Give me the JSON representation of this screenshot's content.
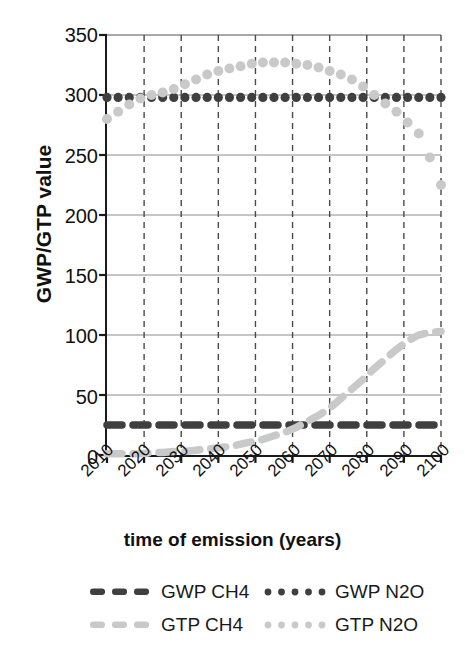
{
  "chart_data": {
    "type": "line",
    "title": "",
    "xlabel": "time of emission (years)",
    "ylabel": "GWP/GTP value",
    "xlim": [
      2010,
      2100
    ],
    "ylim": [
      0,
      350
    ],
    "grid": true,
    "grid_style": {
      "x_gridlines": "dashed",
      "y_gridlines": "solid"
    },
    "legend_position": "bottom",
    "x_ticks": [
      "2010",
      "2020",
      "2030",
      "2040",
      "2050",
      "2060",
      "2070",
      "2080",
      "2090",
      "2100"
    ],
    "x_tick_values": [
      2010,
      2020,
      2030,
      2040,
      2050,
      2060,
      2070,
      2080,
      2090,
      2100
    ],
    "y_ticks": [
      "0",
      "50",
      "100",
      "150",
      "200",
      "250",
      "300",
      "350"
    ],
    "y_tick_values": [
      0,
      50,
      100,
      150,
      200,
      250,
      300,
      350
    ],
    "x": [
      2010,
      2013,
      2016,
      2019,
      2022,
      2025,
      2028,
      2031,
      2034,
      2037,
      2040,
      2043,
      2046,
      2049,
      2052,
      2055,
      2058,
      2061,
      2064,
      2067,
      2070,
      2073,
      2076,
      2079,
      2082,
      2085,
      2088,
      2091,
      2094,
      2097,
      2100
    ],
    "series": [
      {
        "name": "GWP CH4",
        "style": "dashed",
        "color": "#3f3f3f",
        "constant": 25,
        "values": [
          25,
          25,
          25,
          25,
          25,
          25,
          25,
          25,
          25,
          25,
          25,
          25,
          25,
          25,
          25,
          25,
          25,
          25,
          25,
          25,
          25,
          25,
          25,
          25,
          25,
          25,
          25,
          25,
          25,
          25,
          25
        ]
      },
      {
        "name": "GWP N2O",
        "style": "dotted",
        "color": "#3f3f3f",
        "constant": 298,
        "values": [
          298,
          298,
          298,
          298,
          298,
          298,
          298,
          298,
          298,
          298,
          298,
          298,
          298,
          298,
          298,
          298,
          298,
          298,
          298,
          298,
          298,
          298,
          298,
          298,
          298,
          298,
          298,
          298,
          298,
          298,
          298
        ]
      },
      {
        "name": "GTP CH4",
        "style": "dashed",
        "color": "#c9c9c9",
        "values": [
          1,
          1,
          1,
          1,
          2,
          2,
          3,
          3,
          4,
          5,
          6,
          7,
          9,
          11,
          13,
          16,
          19,
          23,
          28,
          33,
          39,
          47,
          55,
          63,
          72,
          80,
          88,
          95,
          100,
          102,
          103
        ]
      },
      {
        "name": "GTP N2O",
        "style": "dotted",
        "color": "#c9c9c9",
        "values": [
          280,
          286,
          292,
          297,
          300,
          302,
          305,
          309,
          313,
          317,
          320,
          322,
          324,
          326,
          327,
          327,
          327,
          326,
          325,
          323,
          320,
          317,
          313,
          307,
          300,
          293,
          286,
          277,
          268,
          248,
          225
        ]
      }
    ]
  },
  "axes": {
    "y_title": "GWP/GTP value",
    "x_title": "time of emission (years)"
  },
  "legend": {
    "rows": [
      {
        "entries": [
          {
            "label": "GWP CH4",
            "marker": "dashed-line-dark",
            "color": "#3f3f3f"
          },
          {
            "label": "GWP N2O",
            "marker": "dotted-line-dark",
            "color": "#3f3f3f"
          }
        ]
      },
      {
        "entries": [
          {
            "label": "GTP CH4",
            "marker": "dashed-line-light",
            "color": "#c9c9c9"
          },
          {
            "label": "GTP N2O",
            "marker": "dotted-line-light",
            "color": "#c9c9c9"
          }
        ]
      }
    ]
  }
}
